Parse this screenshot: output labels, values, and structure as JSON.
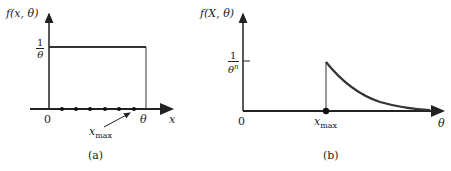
{
  "panel_a": {
    "y_label": "f(x, θ)",
    "y_tick_num": "1",
    "y_tick_den": "θ",
    "origin": "0",
    "theta_tick": "θ",
    "x_label": "x",
    "annotation": "x",
    "annotation_sub": "max",
    "caption": "(a)",
    "sample_dots": 6
  },
  "panel_b": {
    "y_label": "f(X, θ)",
    "y_tick_num": "1",
    "y_tick_den": "θ",
    "y_tick_den_sup": "n",
    "origin": "0",
    "x_tick": "x",
    "x_tick_sub": "max",
    "x_label": "θ",
    "caption": "(b)"
  },
  "colors": {
    "line": "#222222",
    "curve": "#333333"
  }
}
